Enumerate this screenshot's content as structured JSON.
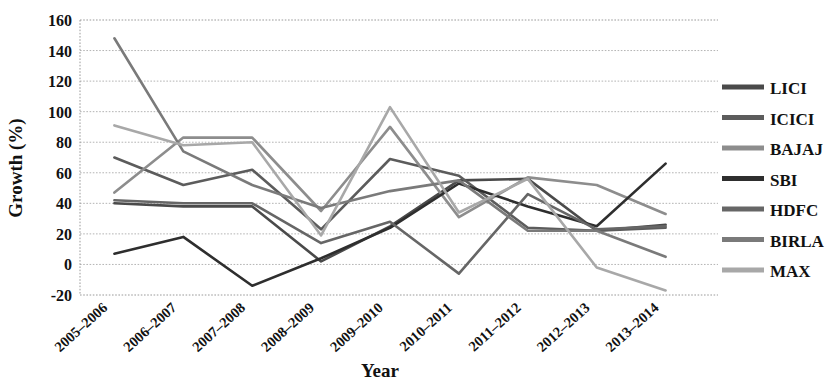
{
  "chart_data": {
    "type": "line",
    "title": "",
    "xlabel": "Year",
    "ylabel": "Growth (%)",
    "ylim": [
      -20,
      160
    ],
    "ytick_step": 20,
    "yticks": [
      "160",
      "140",
      "120",
      "100",
      "80",
      "60",
      "40",
      "20",
      "0",
      "-20"
    ],
    "grid": true,
    "legend_position": "right",
    "categories": [
      "2005–2006",
      "2006–2007",
      "2007–2008",
      "2008–2009",
      "2009–2010",
      "2010–2011",
      "2011–2012",
      "2012–2013",
      "2013–2014"
    ],
    "series": [
      {
        "name": "LICI",
        "color": "#4a4a4a",
        "values": [
          40,
          38,
          38,
          2,
          25,
          55,
          56,
          22,
          26
        ]
      },
      {
        "name": "ICICI",
        "color": "#5c5c5c",
        "values": [
          70,
          52,
          62,
          23,
          69,
          58,
          24,
          22,
          24
        ]
      },
      {
        "name": "BAJAJ",
        "color": "#8d8d8d",
        "values": [
          47,
          83,
          83,
          35,
          90,
          31,
          57,
          52,
          33
        ]
      },
      {
        "name": "SBI",
        "color": "#2e2e2e",
        "values": [
          7,
          18,
          -14,
          4,
          24,
          53,
          38,
          25,
          66
        ]
      },
      {
        "name": "HDFC",
        "color": "#666666",
        "values": [
          42,
          40,
          40,
          14,
          28,
          -6,
          46,
          23,
          25
        ]
      },
      {
        "name": "BIRLA",
        "color": "#7a7a7a",
        "values": [
          148,
          74,
          52,
          37,
          48,
          55,
          22,
          22,
          5
        ]
      },
      {
        "name": "MAX",
        "color": "#a8a8a8",
        "values": [
          91,
          78,
          80,
          19,
          103,
          34,
          56,
          -2,
          -17
        ]
      }
    ]
  },
  "legend": {
    "items": [
      {
        "label": "LICI"
      },
      {
        "label": "ICICI"
      },
      {
        "label": "BAJAJ"
      },
      {
        "label": "SBI"
      },
      {
        "label": "HDFC"
      },
      {
        "label": "BIRLA"
      },
      {
        "label": "MAX"
      }
    ]
  },
  "axes": {
    "y_title": "Growth (%)",
    "x_title": "Year"
  }
}
